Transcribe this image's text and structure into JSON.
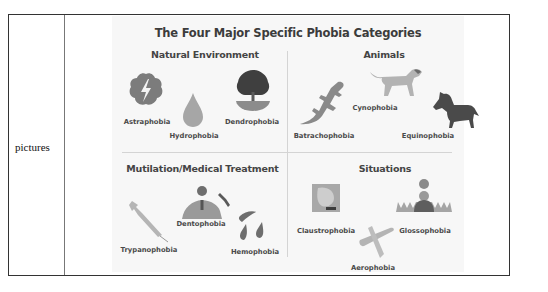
{
  "row": {
    "label": "pictures"
  },
  "figure": {
    "title": "The Four Major Specific Phobia Categories",
    "colors": {
      "icon_dark": "#555555",
      "icon_mid": "#8a8a8a",
      "icon_light": "#b8b8b8",
      "text": "#444444"
    },
    "sections": [
      {
        "title": "Natural Environment",
        "items": [
          {
            "label": "Astraphobia",
            "icon": "storm-cloud-lightning-icon"
          },
          {
            "label": "Hydrophobia",
            "icon": "water-drop-icon"
          },
          {
            "label": "Dendrophobia",
            "icon": "tree-icon"
          }
        ]
      },
      {
        "title": "Animals",
        "items": [
          {
            "label": "Batrachophobia",
            "icon": "lizard-icon"
          },
          {
            "label": "Cynophobia",
            "icon": "dog-icon"
          },
          {
            "label": "Equinophobia",
            "icon": "horse-icon"
          }
        ]
      },
      {
        "title": "Mutilation/Medical Treatment",
        "items": [
          {
            "label": "Trypanophobia",
            "icon": "syringe-icon"
          },
          {
            "label": "Dentophobia",
            "icon": "dentist-icon"
          },
          {
            "label": "Hemophobia",
            "icon": "blood-drops-icon"
          }
        ]
      },
      {
        "title": "Situations",
        "items": [
          {
            "label": "Claustrophobia",
            "icon": "enclosed-space-icon"
          },
          {
            "label": "Glossophobia",
            "icon": "public-speaking-icon"
          },
          {
            "label": "Aerophobia",
            "icon": "airplane-icon"
          }
        ]
      }
    ]
  }
}
